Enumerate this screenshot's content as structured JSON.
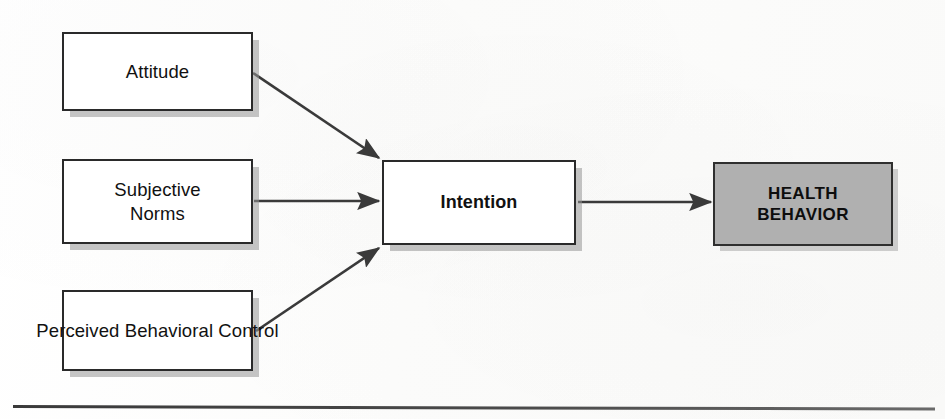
{
  "figure": {
    "background_color": "#fdfdfd",
    "box_border_color": "#2a2a2a",
    "box_fill_color": "#ffffff",
    "highlight_fill_color": "#b0b0b0",
    "arrow_color": "#3a3a3a"
  },
  "nodes": {
    "attitude": {
      "label": "Attitude",
      "fill": "#ffffff",
      "emphasis": "normal"
    },
    "subjective_norms": {
      "label": "Subjective\nNorms",
      "fill": "#ffffff",
      "emphasis": "normal"
    },
    "perceived_behavioral_control": {
      "label": "Perceived\nBehavioral Control",
      "fill": "#ffffff",
      "emphasis": "normal"
    },
    "intention": {
      "label": "Intention",
      "fill": "#ffffff",
      "emphasis": "bold"
    },
    "health_behavior": {
      "label": "HEALTH\nBEHAVIOR",
      "fill": "#b0b0b0",
      "emphasis": "bold"
    }
  },
  "edges": [
    {
      "id": "attitude-to-intention",
      "from": "attitude",
      "to": "intention",
      "style": "diagonal-down"
    },
    {
      "id": "subjective-norms-to-intention",
      "from": "subjective_norms",
      "to": "intention",
      "style": "horizontal"
    },
    {
      "id": "perceived-behavioral-control-to-intention",
      "from": "perceived_behavioral_control",
      "to": "intention",
      "style": "diagonal-up"
    },
    {
      "id": "intention-to-health-behavior",
      "from": "intention",
      "to": "health_behavior",
      "style": "horizontal"
    }
  ],
  "footer_rule": {
    "present": true
  }
}
